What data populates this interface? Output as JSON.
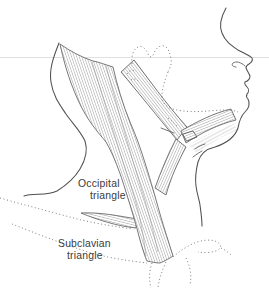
{
  "figure": {
    "labels": {
      "occipital_line1": "Occipital",
      "occipital_line2": "triangle",
      "subclavian_line1": "Subclavian",
      "subclavian_line2": "triangle"
    },
    "palette": {
      "background": "#ffffff",
      "ink": "#4f4f4f",
      "muscle_edge": "#606060",
      "hatch": "#9c9c9c",
      "dotted": "#6f6f6f",
      "label_text": "#3b3b3b",
      "artifact": "#dcdcdc"
    }
  }
}
